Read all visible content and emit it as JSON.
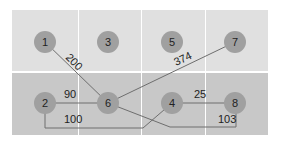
{
  "grid": {
    "x": 12,
    "y": 10,
    "width": 256,
    "height": 125,
    "columns": [
      12,
      79,
      142,
      206
    ],
    "column_widths": [
      66,
      62,
      63,
      62
    ],
    "rows": [
      {
        "name": "top-row",
        "y": 10,
        "height": 61,
        "color": "#e0e0e0"
      },
      {
        "name": "bottom-row",
        "y": 73,
        "height": 62,
        "color": "#c8c8c8"
      }
    ],
    "divider_color": "#ffffff"
  },
  "nodes": [
    {
      "id": "1",
      "label": "1",
      "cx": 45,
      "cy": 42
    },
    {
      "id": "3",
      "label": "3",
      "cx": 108,
      "cy": 42
    },
    {
      "id": "5",
      "label": "5",
      "cx": 172,
      "cy": 42
    },
    {
      "id": "7",
      "label": "7",
      "cx": 235,
      "cy": 42
    },
    {
      "id": "2",
      "label": "2",
      "cx": 45,
      "cy": 103
    },
    {
      "id": "6",
      "label": "6",
      "cx": 108,
      "cy": 103
    },
    {
      "id": "4",
      "label": "4",
      "cx": 172,
      "cy": 103
    },
    {
      "id": "8",
      "label": "8",
      "cx": 235,
      "cy": 103
    }
  ],
  "node_style": {
    "radius": 11,
    "fill": "#a0a0a0",
    "text_color": "#222222"
  },
  "edges": [
    {
      "from": "1",
      "to": "6",
      "weight": "200",
      "points": "45,42 108,103",
      "label_x": 65,
      "label_y": 58,
      "label_rotate": 45
    },
    {
      "from": "6",
      "to": "7",
      "weight": "374",
      "points": "108,103 235,42",
      "label_x": 176,
      "label_y": 66,
      "label_rotate": -25
    },
    {
      "from": "2",
      "to": "6",
      "weight": "90",
      "points": "45,103 108,103",
      "label_x": 64,
      "label_y": 98,
      "label_rotate": 0
    },
    {
      "from": "4",
      "to": "8",
      "weight": "25",
      "points": "172,103 235,103",
      "label_x": 194,
      "label_y": 98,
      "label_rotate": 0
    },
    {
      "from": "2",
      "to": "4",
      "weight": "100",
      "points": "45,103 45,128 143,128 172,103",
      "label_x": 64,
      "label_y": 123,
      "label_rotate": 0
    },
    {
      "from": "6",
      "to": "8",
      "weight": "103",
      "points": "108,103 170,127 236,127 236,103",
      "label_x": 218,
      "label_y": 123,
      "label_rotate": 0
    }
  ],
  "edge_style": {
    "stroke": "#6e6e6e",
    "width": 1
  },
  "label_style": {
    "color": "#222222",
    "size": 11
  }
}
